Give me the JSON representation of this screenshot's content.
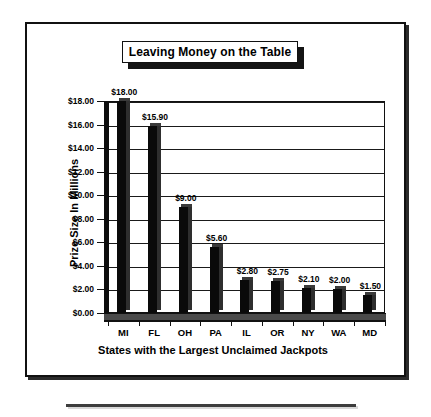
{
  "chart_data": {
    "type": "bar",
    "title": "Leaving Money on the Table",
    "xlabel": "States with the Largest Unclaimed Jackpots",
    "ylabel": "Prize Size In Millions",
    "categories": [
      "MI",
      "FL",
      "OH",
      "PA",
      "IL",
      "OR",
      "NY",
      "WA",
      "MD"
    ],
    "values": [
      18.0,
      15.9,
      9.0,
      5.6,
      2.8,
      2.75,
      2.1,
      2.0,
      1.5
    ],
    "data_labels": [
      "$18.00",
      "$15.90",
      "$9.00",
      "$5.60",
      "$2.80",
      "$2.75",
      "$2.10",
      "$2.00",
      "$1.50"
    ],
    "ylim": [
      0,
      18
    ],
    "ytick_values": [
      0,
      2,
      4,
      6,
      8,
      10,
      12,
      14,
      16,
      18
    ],
    "ytick_labels": [
      "$0.00",
      "$2.00",
      "$4.00",
      "$6.00",
      "$8.00",
      "$10.00",
      "$12.00",
      "$14.00",
      "$16.00",
      "$18.00"
    ],
    "grid": true,
    "legend": false,
    "bar_color": "#0a0a0a",
    "background_color": "#ffffff"
  },
  "colors": {
    "frame": "#111111",
    "bar": "#0a0a0a",
    "bar_side": "#2e2e2e",
    "gridline": "#1a1a1a",
    "text": "#000000",
    "floor": "#4a4a4a"
  }
}
